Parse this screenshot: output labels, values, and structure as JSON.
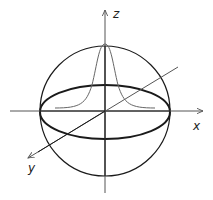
{
  "diagram": {
    "type": "3d-axes-sphere",
    "axes": [
      {
        "name": "x",
        "label": "x"
      },
      {
        "name": "y",
        "label": "y"
      },
      {
        "name": "z",
        "label": "z"
      }
    ],
    "elements": [
      "sphere-outline",
      "equator-ellipse",
      "gaussian-curve"
    ],
    "colors": {
      "stroke_main": "#1a1a1a",
      "stroke_axis": "#555555",
      "stroke_curve": "#666666"
    }
  }
}
